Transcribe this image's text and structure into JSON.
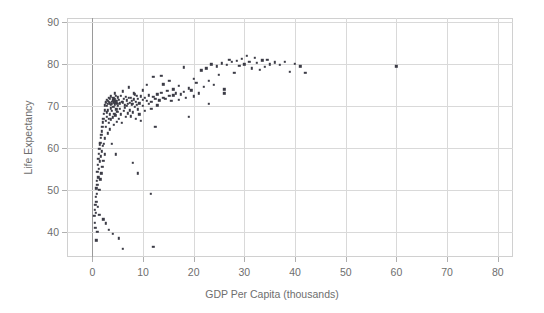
{
  "chart_data": {
    "type": "scatter",
    "title": "",
    "xlabel": "GDP Per Capita (thousands)",
    "ylabel": "Life Expectancy",
    "xlim": [
      -5,
      83
    ],
    "ylim": [
      34,
      91
    ],
    "xticks": [
      0,
      10,
      20,
      30,
      40,
      50,
      60,
      70,
      80
    ],
    "xticklabels": [
      "0",
      "10",
      "20",
      "30",
      "40",
      "50",
      "60",
      "70",
      "80"
    ],
    "yticks": [
      40,
      50,
      60,
      70,
      80,
      90
    ],
    "yticklabels": [
      "40",
      "50",
      "60",
      "70",
      "80",
      "90"
    ],
    "grid": true,
    "legend": false,
    "marker": "square",
    "marker_color": "#3c3c46",
    "marker_size": 2.4,
    "grid_color": "#d9d9d9",
    "frame_color": "#d0d0d0",
    "text_color": "#6e6e6e",
    "background": "#ffffff",
    "points": [
      [
        0.4,
        43.8
      ],
      [
        0.5,
        42.1
      ],
      [
        0.5,
        45.3
      ],
      [
        0.6,
        41.0
      ],
      [
        0.6,
        46.5
      ],
      [
        0.7,
        48.3
      ],
      [
        0.7,
        44.6
      ],
      [
        0.8,
        50.4
      ],
      [
        0.8,
        47.2
      ],
      [
        0.9,
        52.1
      ],
      [
        0.9,
        49.0
      ],
      [
        1.0,
        54.3
      ],
      [
        1.0,
        51.2
      ],
      [
        1.1,
        56.0
      ],
      [
        1.1,
        46.0
      ],
      [
        1.2,
        57.4
      ],
      [
        1.2,
        53.0
      ],
      [
        1.3,
        58.6
      ],
      [
        1.3,
        55.1
      ],
      [
        1.4,
        59.8
      ],
      [
        1.4,
        50.0
      ],
      [
        1.5,
        60.9
      ],
      [
        1.5,
        56.8
      ],
      [
        1.6,
        61.3
      ],
      [
        1.6,
        52.5
      ],
      [
        1.7,
        62.4
      ],
      [
        1.7,
        58.0
      ],
      [
        1.8,
        63.1
      ],
      [
        1.8,
        54.0
      ],
      [
        1.9,
        64.0
      ],
      [
        1.9,
        59.2
      ],
      [
        2.0,
        65.0
      ],
      [
        2.0,
        55.5
      ],
      [
        2.1,
        66.1
      ],
      [
        2.1,
        60.5
      ],
      [
        2.2,
        67.0
      ],
      [
        2.2,
        57.0
      ],
      [
        2.3,
        68.2
      ],
      [
        2.3,
        61.0
      ],
      [
        2.4,
        69.0
      ],
      [
        2.4,
        58.5
      ],
      [
        2.5,
        70.2
      ],
      [
        2.5,
        62.3
      ],
      [
        2.6,
        71.0
      ],
      [
        2.6,
        65.0
      ],
      [
        2.7,
        70.8
      ],
      [
        2.7,
        66.5
      ],
      [
        2.8,
        71.5
      ],
      [
        2.8,
        67.5
      ],
      [
        2.9,
        70.0
      ],
      [
        2.9,
        68.5
      ],
      [
        3.0,
        71.2
      ],
      [
        3.0,
        63.5
      ],
      [
        3.1,
        70.5
      ],
      [
        3.1,
        69.0
      ],
      [
        3.2,
        72.0
      ],
      [
        3.2,
        66.0
      ],
      [
        3.3,
        71.0
      ],
      [
        3.3,
        67.0
      ],
      [
        3.4,
        70.7
      ],
      [
        3.4,
        64.5
      ],
      [
        3.5,
        71.8
      ],
      [
        3.5,
        68.0
      ],
      [
        3.6,
        70.3
      ],
      [
        3.6,
        69.5
      ],
      [
        3.7,
        72.3
      ],
      [
        3.7,
        66.8
      ],
      [
        3.8,
        71.0
      ],
      [
        3.8,
        61.0
      ],
      [
        3.9,
        70.6
      ],
      [
        3.9,
        68.8
      ],
      [
        4.0,
        71.4
      ],
      [
        4.0,
        67.3
      ],
      [
        4.1,
        72.0
      ],
      [
        4.1,
        69.8
      ],
      [
        4.2,
        70.9
      ],
      [
        4.2,
        65.5
      ],
      [
        4.3,
        71.6
      ],
      [
        4.3,
        68.2
      ],
      [
        4.4,
        70.4
      ],
      [
        4.4,
        73.0
      ],
      [
        4.5,
        71.1
      ],
      [
        4.5,
        67.8
      ],
      [
        4.6,
        72.5
      ],
      [
        4.6,
        58.5
      ],
      [
        4.7,
        70.8
      ],
      [
        4.7,
        69.2
      ],
      [
        4.8,
        71.3
      ],
      [
        4.8,
        66.3
      ],
      [
        4.9,
        70.5
      ],
      [
        4.9,
        68.6
      ],
      [
        5.0,
        72.1
      ],
      [
        5.0,
        70.0
      ],
      [
        5.2,
        71.5
      ],
      [
        5.2,
        67.0
      ],
      [
        5.4,
        70.7
      ],
      [
        5.4,
        69.4
      ],
      [
        5.6,
        72.4
      ],
      [
        5.6,
        68.0
      ],
      [
        5.8,
        71.0
      ],
      [
        5.8,
        66.0
      ],
      [
        6.0,
        70.9
      ],
      [
        6.0,
        73.5
      ],
      [
        6.2,
        71.7
      ],
      [
        6.2,
        68.8
      ],
      [
        6.4,
        70.2
      ],
      [
        6.4,
        69.6
      ],
      [
        6.6,
        72.2
      ],
      [
        6.6,
        67.4
      ],
      [
        6.8,
        71.4
      ],
      [
        6.8,
        70.0
      ],
      [
        7.0,
        70.6
      ],
      [
        7.0,
        68.3
      ],
      [
        7.2,
        71.9
      ],
      [
        7.2,
        74.5
      ],
      [
        7.4,
        70.8
      ],
      [
        7.4,
        69.0
      ],
      [
        7.6,
        72.0
      ],
      [
        7.6,
        67.6
      ],
      [
        7.8,
        71.2
      ],
      [
        7.8,
        70.4
      ],
      [
        8.0,
        70.5
      ],
      [
        8.0,
        68.5
      ],
      [
        8.2,
        71.6
      ],
      [
        8.2,
        73.0
      ],
      [
        8.4,
        72.8
      ],
      [
        8.4,
        69.8
      ],
      [
        8.6,
        71.0
      ],
      [
        8.6,
        67.0
      ],
      [
        8.8,
        70.3
      ],
      [
        8.8,
        72.5
      ],
      [
        9.0,
        71.8
      ],
      [
        9.0,
        69.2
      ],
      [
        9.3,
        70.7
      ],
      [
        9.3,
        68.0
      ],
      [
        9.6,
        72.3
      ],
      [
        9.6,
        66.5
      ],
      [
        10.0,
        71.5
      ],
      [
        10.0,
        73.8
      ],
      [
        10.0,
        70.0
      ],
      [
        10.4,
        72.0
      ],
      [
        10.4,
        68.8
      ],
      [
        10.8,
        71.3
      ],
      [
        10.8,
        75.0
      ],
      [
        11.2,
        72.6
      ],
      [
        11.2,
        70.6
      ],
      [
        11.6,
        71.0
      ],
      [
        11.6,
        69.4
      ],
      [
        12.0,
        72.2
      ],
      [
        12.0,
        77.0
      ],
      [
        12.4,
        71.7
      ],
      [
        12.4,
        65.0
      ],
      [
        12.8,
        72.8
      ],
      [
        12.8,
        70.2
      ],
      [
        13.2,
        71.4
      ],
      [
        13.6,
        73.2
      ],
      [
        13.6,
        77.2
      ],
      [
        14.0,
        72.0
      ],
      [
        14.0,
        75.2
      ],
      [
        14.4,
        71.8
      ],
      [
        14.8,
        73.6
      ],
      [
        15.2,
        72.4
      ],
      [
        15.2,
        76.0
      ],
      [
        15.6,
        71.2
      ],
      [
        16.0,
        74.0
      ],
      [
        16.0,
        72.6
      ],
      [
        16.5,
        73.0
      ],
      [
        17.0,
        71.5
      ],
      [
        17.0,
        74.8
      ],
      [
        17.5,
        72.8
      ],
      [
        18.0,
        79.2
      ],
      [
        18.0,
        73.4
      ],
      [
        18.5,
        72.0
      ],
      [
        19.0,
        74.2
      ],
      [
        19.5,
        73.8
      ],
      [
        20.0,
        76.5
      ],
      [
        20.0,
        72.3
      ],
      [
        20.5,
        75.5
      ],
      [
        21.0,
        73.0
      ],
      [
        21.5,
        78.5
      ],
      [
        22.0,
        74.6
      ],
      [
        22.5,
        79.0
      ],
      [
        23.0,
        76.0
      ],
      [
        23.5,
        80.0
      ],
      [
        24.0,
        75.0
      ],
      [
        24.5,
        79.5
      ],
      [
        25.0,
        77.5
      ],
      [
        25.5,
        80.2
      ],
      [
        26.0,
        74.0
      ],
      [
        26.5,
        79.8
      ],
      [
        27.0,
        81.0
      ],
      [
        27.5,
        80.5
      ],
      [
        28.0,
        78.0
      ],
      [
        28.5,
        80.8
      ],
      [
        29.0,
        79.6
      ],
      [
        29.5,
        81.2
      ],
      [
        30.0,
        80.0
      ],
      [
        30.5,
        82.0
      ],
      [
        31.0,
        80.6
      ],
      [
        31.5,
        79.0
      ],
      [
        32.0,
        81.5
      ],
      [
        32.5,
        80.3
      ],
      [
        33.0,
        78.6
      ],
      [
        33.5,
        80.9
      ],
      [
        34.0,
        79.4
      ],
      [
        34.5,
        81.0
      ],
      [
        35.0,
        80.0
      ],
      [
        36.0,
        80.4
      ],
      [
        37.0,
        79.8
      ],
      [
        38.0,
        80.6
      ],
      [
        39.0,
        78.2
      ],
      [
        40.0,
        80.1
      ],
      [
        41.0,
        79.5
      ],
      [
        42.0,
        78.0
      ],
      [
        12.0,
        36.5
      ],
      [
        6.0,
        36.0
      ],
      [
        5.2,
        38.5
      ],
      [
        4.0,
        39.5
      ],
      [
        3.2,
        40.5
      ],
      [
        2.6,
        42.0
      ],
      [
        2.2,
        43.0
      ],
      [
        1.4,
        44.0
      ],
      [
        1.0,
        40.0
      ],
      [
        0.8,
        38.0
      ],
      [
        11.5,
        49.0
      ],
      [
        9.0,
        54.0
      ],
      [
        8.0,
        56.5
      ],
      [
        19.0,
        67.5
      ],
      [
        23.0,
        70.5
      ],
      [
        26.0,
        73.0
      ],
      [
        60.0,
        79.5
      ]
    ]
  }
}
